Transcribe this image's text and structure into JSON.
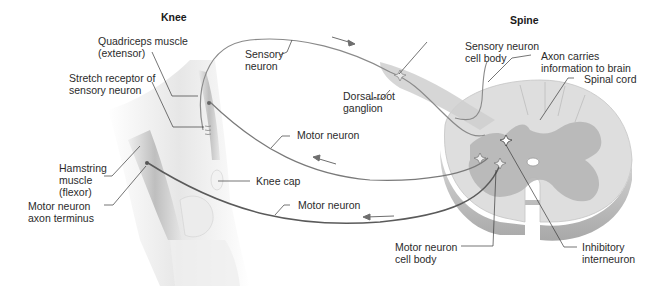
{
  "titles": {
    "knee": "Knee",
    "spine": "Spine"
  },
  "labels": {
    "quadriceps": [
      "Quadriceps muscle",
      "(extensor)"
    ],
    "stretch_receptor": [
      "Stretch receptor of",
      "sensory neuron"
    ],
    "sensory_neuron": [
      "Sensory",
      "neuron"
    ],
    "sensory_cell_body": [
      "Sensory neuron",
      "cell body"
    ],
    "axon_brain": [
      "Axon carries",
      "information to brain"
    ],
    "dorsal_root": [
      "Dorsal-root",
      "ganglion"
    ],
    "spinal_cord": [
      "Spinal cord"
    ],
    "motor_neuron_upper": [
      "Motor neuron"
    ],
    "hamstring": [
      "Hamstring",
      "muscle",
      "(flexor)"
    ],
    "knee_cap": [
      "Knee cap"
    ],
    "motor_terminus": [
      "Motor neuron",
      "axon terminus"
    ],
    "motor_neuron_lower": [
      "Motor neuron"
    ],
    "motor_cell_body": [
      "Motor neuron",
      "cell body"
    ],
    "inhibitory": [
      "Inhibitory",
      "interneuron"
    ]
  },
  "colors": {
    "sensory_line": "#8a8a8a",
    "motor_line_upper": "#7a7a7a",
    "motor_line_lower": "#5a5a5a",
    "arrow": "#6e6e6e",
    "cord_white_matter": "#dcdcdc",
    "cord_gray_matter": "#b4b4b4",
    "cord_edge": "#c8c8c8",
    "leader": "#3a3a3a",
    "muscle": "#c9c9c9"
  }
}
